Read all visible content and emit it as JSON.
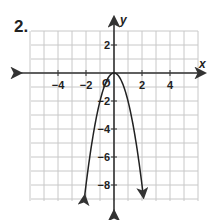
{
  "problem": {
    "number_label": "2."
  },
  "chart_data": {
    "type": "line",
    "title": "",
    "xlabel": "x",
    "ylabel": "y",
    "xlim": [
      -6,
      6
    ],
    "ylim": [
      -9.5,
      3
    ],
    "grid": true,
    "x_tick_labels": [
      {
        "value": -4,
        "label": "−4"
      },
      {
        "value": -2,
        "label": "−2"
      },
      {
        "value": 0,
        "label": "Ø"
      },
      {
        "value": 2,
        "label": "2"
      },
      {
        "value": 4,
        "label": "4"
      }
    ],
    "y_tick_labels": [
      {
        "value": 2,
        "label": "2"
      },
      {
        "value": -2,
        "label": "−2"
      },
      {
        "value": -4,
        "label": "−4"
      },
      {
        "value": -6,
        "label": "−6"
      },
      {
        "value": -8,
        "label": "−8"
      }
    ],
    "series": [
      {
        "name": "parabola",
        "equation": "y = -2x^2",
        "vertex": [
          0,
          0
        ],
        "x": [
          -2.1,
          -2,
          -1.5,
          -1,
          -0.5,
          0,
          0.5,
          1,
          1.5,
          2,
          2.1
        ],
        "y": [
          -8.82,
          -8,
          -4.5,
          -2,
          -0.5,
          0,
          -0.5,
          -2,
          -4.5,
          -8,
          -8.82
        ],
        "arrows_at_ends": true
      }
    ]
  },
  "colors": {
    "grid": "#c8c8c8",
    "axis": "#333333",
    "curve": "#222222"
  }
}
